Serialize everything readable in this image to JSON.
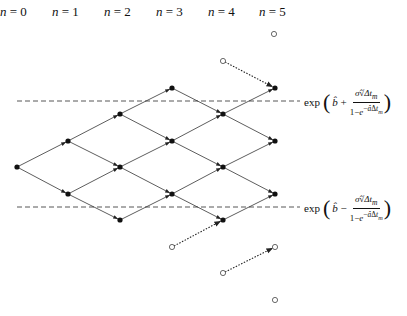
{
  "diagram": {
    "type": "trinomial/binomial lattice",
    "step_labels": [
      "n = 0",
      "n = 1",
      "n = 2",
      "n = 3",
      "n = 4",
      "n = 5"
    ],
    "upper_bound_formula": {
      "prefix": "exp",
      "lead": "b̂ +",
      "numerator": "σ̂ √Δt_m",
      "denominator": "1−e^(−âΔt_m)"
    },
    "lower_bound_formula": {
      "prefix": "exp",
      "lead": "b̂ −",
      "numerator": "σ̂ √Δt_m",
      "denominator": "1−e^(−âΔt_m)"
    },
    "colors": {
      "line": "#333333",
      "node": "#111111",
      "dashed": "#444444"
    }
  }
}
